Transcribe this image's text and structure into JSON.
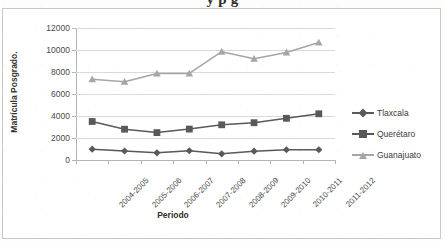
{
  "page": {
    "cut_off_heading": "y  p g",
    "background_color": "#fdfdfc",
    "frame_border_color": "#c8c8c8"
  },
  "chart_data": {
    "type": "line",
    "title": "",
    "xlabel": "Periodo",
    "ylabel": "Matrícula Posgrado.",
    "categories": [
      "2004-2005",
      "2005-2006",
      "2006-2007",
      "2007-2008",
      "2008-2009",
      "2009-2010",
      "2010-2011",
      "2011-2012"
    ],
    "ylim": [
      0,
      12000
    ],
    "yticks": [
      0,
      2000,
      4000,
      6000,
      8000,
      10000,
      12000
    ],
    "ytick_labels": [
      "0",
      "2000",
      "4000",
      "6000",
      "8000",
      "10000",
      "12000"
    ],
    "grid": true,
    "legend_position": "right",
    "series": [
      {
        "name": "Tlaxcala",
        "color": "#595959",
        "marker": "diamond",
        "values": [
          980,
          820,
          650,
          840,
          560,
          800,
          930,
          930
        ]
      },
      {
        "name": "Querétaro",
        "color": "#595959",
        "marker": "square",
        "values": [
          3500,
          2800,
          2490,
          2810,
          3200,
          3390,
          3790,
          4200
        ]
      },
      {
        "name": "Guanajuato",
        "color": "#a6a6a6",
        "marker": "triangle",
        "values": [
          7330,
          7120,
          7860,
          7870,
          9850,
          9200,
          9780,
          10680
        ]
      }
    ]
  }
}
